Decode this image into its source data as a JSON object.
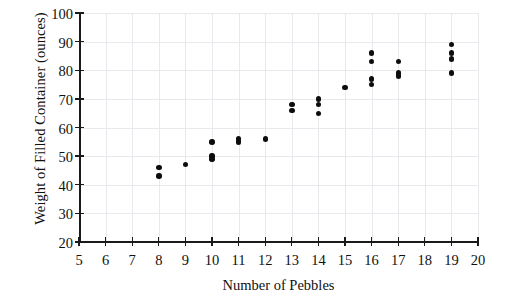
{
  "chart_data": {
    "type": "scatter",
    "title": "",
    "xlabel": "Number of Pebbles",
    "ylabel": "Weight of Filled Container (ounces)",
    "xlim": [
      5,
      20
    ],
    "ylim": [
      20,
      100
    ],
    "xticks": [
      5,
      6,
      7,
      8,
      9,
      10,
      11,
      12,
      13,
      14,
      15,
      16,
      17,
      18,
      19,
      20
    ],
    "yticks": [
      20,
      30,
      40,
      50,
      60,
      70,
      80,
      90,
      100
    ],
    "xtick_labels": [
      "5",
      "6",
      "7",
      "8",
      "9",
      "10",
      "11",
      "12",
      "13",
      "14",
      "15",
      "16",
      "17",
      "18",
      "19",
      "20"
    ],
    "ytick_labels": [
      "20",
      "30",
      "40",
      "50",
      "60",
      "70",
      "80",
      "90",
      "100"
    ],
    "grid": true,
    "legend": "none",
    "marker_color": "#0d0d0d",
    "grid_color": "#e9e9ed",
    "axis_color": "#1a1a1a",
    "points": [
      {
        "x": 8,
        "y": 46
      },
      {
        "x": 8,
        "y": 43
      },
      {
        "x": 9,
        "y": 47
      },
      {
        "x": 10,
        "y": 55
      },
      {
        "x": 10,
        "y": 50
      },
      {
        "x": 10,
        "y": 49
      },
      {
        "x": 11,
        "y": 56
      },
      {
        "x": 11,
        "y": 55
      },
      {
        "x": 12,
        "y": 56
      },
      {
        "x": 13,
        "y": 68
      },
      {
        "x": 13,
        "y": 66
      },
      {
        "x": 14,
        "y": 70
      },
      {
        "x": 14,
        "y": 68
      },
      {
        "x": 14,
        "y": 65
      },
      {
        "x": 15,
        "y": 74
      },
      {
        "x": 16,
        "y": 86
      },
      {
        "x": 16,
        "y": 83
      },
      {
        "x": 16,
        "y": 77
      },
      {
        "x": 16,
        "y": 75
      },
      {
        "x": 17,
        "y": 83
      },
      {
        "x": 17,
        "y": 79
      },
      {
        "x": 17,
        "y": 78
      },
      {
        "x": 19,
        "y": 89
      },
      {
        "x": 19,
        "y": 86
      },
      {
        "x": 19,
        "y": 84
      },
      {
        "x": 19,
        "y": 79
      }
    ]
  }
}
